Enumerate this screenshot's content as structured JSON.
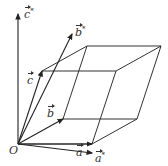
{
  "diagram": {
    "origin_label": "O",
    "vectors": [
      {
        "id": "a",
        "symbol": "a",
        "star": false
      },
      {
        "id": "b",
        "symbol": "b",
        "star": false
      },
      {
        "id": "c",
        "symbol": "c",
        "star": false
      },
      {
        "id": "a_star",
        "symbol": "a",
        "star": true
      },
      {
        "id": "b_star",
        "symbol": "b",
        "star": true
      },
      {
        "id": "c_star",
        "symbol": "c",
        "star": true
      }
    ],
    "star_mark": "*",
    "colors": {
      "line": "#333333",
      "background": "#ffffff"
    }
  }
}
